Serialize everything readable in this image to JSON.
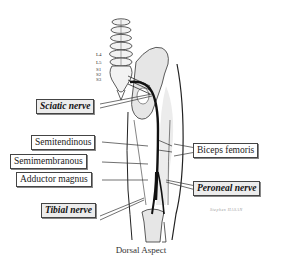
{
  "diagram": {
    "caption": "Dorsal Aspect",
    "vertebra_labels": [
      "L4",
      "L5",
      "S1",
      "S2",
      "S3"
    ],
    "labels": {
      "sciatic": "Sciatic nerve",
      "semitendinous": "Semitendinous",
      "semimembranous": "Semimembranous",
      "adductor": "Adductor magnus",
      "tibial": "Tibial nerve",
      "biceps": "Biceps femoris",
      "peroneal": "Peroneal nerve"
    },
    "signature": "Stephen HASAN",
    "colors": {
      "outline": "#222222",
      "bone_fill": "#e6e6e6",
      "nerve": "#111111",
      "label_border": "#444444",
      "nerve_label_bg": "#ececec"
    }
  }
}
